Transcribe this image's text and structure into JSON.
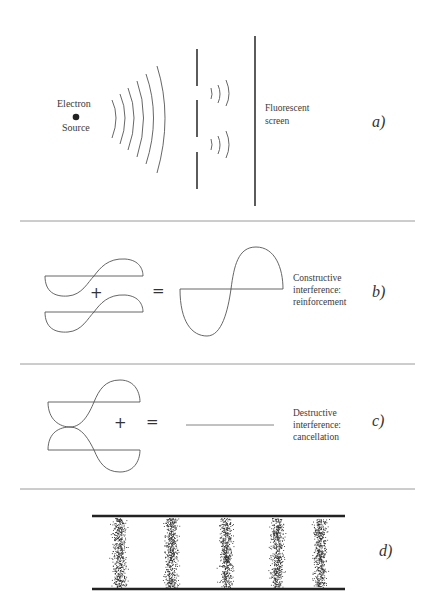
{
  "panels": {
    "a": {
      "letter": "a)",
      "source_label_top": "Electron",
      "source_label_bottom": "Source",
      "screen_label_line1": "Fluorescent",
      "screen_label_line2": "screen"
    },
    "b": {
      "letter": "b)",
      "plus": "+",
      "equals": "=",
      "caption_line1": "Constructive",
      "caption_line2": "interference:",
      "caption_line3": "reinforcement"
    },
    "c": {
      "letter": "c)",
      "plus": "+",
      "equals": "=",
      "caption_line1": "Destructive",
      "caption_line2": "interference:",
      "caption_line3": "cancellation"
    },
    "d": {
      "letter": "d)",
      "band_count": 5,
      "band_centers_x": [
        119,
        171,
        226,
        277,
        320
      ]
    }
  },
  "colors": {
    "ink": "#333333",
    "divider": "#9a9a9a",
    "dots": "#2a2a2a"
  }
}
